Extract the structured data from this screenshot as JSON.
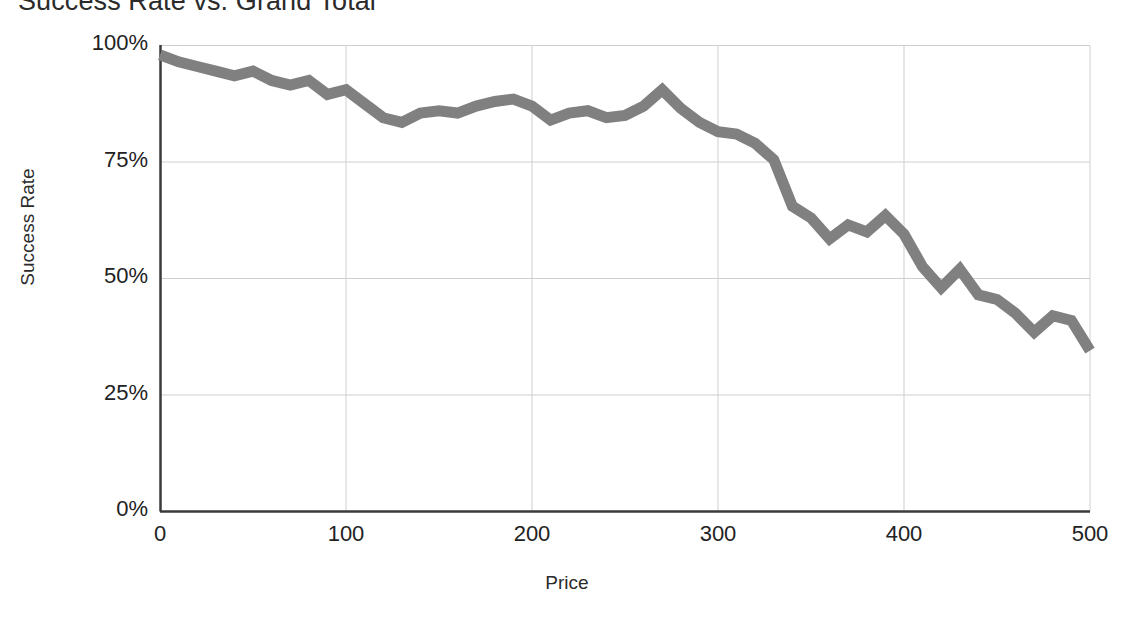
{
  "chart_data": {
    "type": "line",
    "title": "Success Rate vs. Grand Total",
    "xlabel": "Price",
    "ylabel": "Success Rate",
    "xlim": [
      0,
      500
    ],
    "ylim": [
      0,
      1.0
    ],
    "grid": true,
    "legend": "none",
    "line_color": "#808080",
    "line_width_px": 11,
    "x_ticks": [
      {
        "value": 0,
        "label": "0"
      },
      {
        "value": 100,
        "label": "100"
      },
      {
        "value": 200,
        "label": "200"
      },
      {
        "value": 300,
        "label": "300"
      },
      {
        "value": 400,
        "label": "400"
      },
      {
        "value": 500,
        "label": "500"
      }
    ],
    "y_ticks": [
      {
        "value": 0.0,
        "label": "0%"
      },
      {
        "value": 0.25,
        "label": "25%"
      },
      {
        "value": 0.5,
        "label": "50%"
      },
      {
        "value": 0.75,
        "label": "75%"
      },
      {
        "value": 1.0,
        "label": "100%"
      }
    ],
    "series": [
      {
        "name": "Success Rate",
        "x": [
          0,
          10,
          20,
          30,
          40,
          50,
          60,
          70,
          80,
          90,
          100,
          110,
          120,
          130,
          140,
          150,
          160,
          170,
          180,
          190,
          200,
          210,
          220,
          230,
          240,
          250,
          260,
          270,
          280,
          290,
          300,
          310,
          320,
          330,
          340,
          350,
          360,
          370,
          380,
          390,
          400,
          410,
          420,
          430,
          440,
          450,
          460,
          470,
          480,
          490,
          500
        ],
        "values": [
          0.98,
          0.965,
          0.955,
          0.945,
          0.935,
          0.945,
          0.925,
          0.915,
          0.925,
          0.895,
          0.905,
          0.875,
          0.845,
          0.835,
          0.855,
          0.86,
          0.855,
          0.87,
          0.88,
          0.885,
          0.87,
          0.84,
          0.855,
          0.86,
          0.845,
          0.85,
          0.87,
          0.905,
          0.865,
          0.835,
          0.815,
          0.81,
          0.79,
          0.755,
          0.745,
          0.735,
          0.72,
          0.715,
          0.705,
          0.695,
          0.73,
          0.695,
          0.665,
          0.645,
          0.67,
          0.59,
          0.625,
          0.6,
          0.635,
          0.6,
          0.525
        ],
        "values_note": "values are fractions of 1.0 (success rate)"
      }
    ],
    "series_tail": {
      "x": [
        340,
        350,
        360,
        370,
        380,
        390,
        400,
        410,
        420,
        430,
        440,
        450,
        460,
        470,
        480,
        490,
        500
      ],
      "values": [
        0.655,
        0.63,
        0.585,
        0.615,
        0.6,
        0.635,
        0.595,
        0.525,
        0.48,
        0.52,
        0.465,
        0.455,
        0.425,
        0.385,
        0.42,
        0.41,
        0.345
      ]
    }
  }
}
